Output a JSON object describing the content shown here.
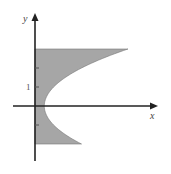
{
  "diagram": {
    "type": "shaded-region",
    "curve": "x = 1 + y^2",
    "y_range": [
      -2,
      3
    ],
    "axes": {
      "x_label": "x",
      "y_label": "y"
    },
    "y_ticks": [
      2,
      1,
      -1
    ],
    "y_tick_labels": [
      {
        "value": 1,
        "label": "1"
      }
    ],
    "colors": {
      "region_fill": "#a6a6a6",
      "axis": "#222222",
      "background": "#ffffff"
    }
  }
}
